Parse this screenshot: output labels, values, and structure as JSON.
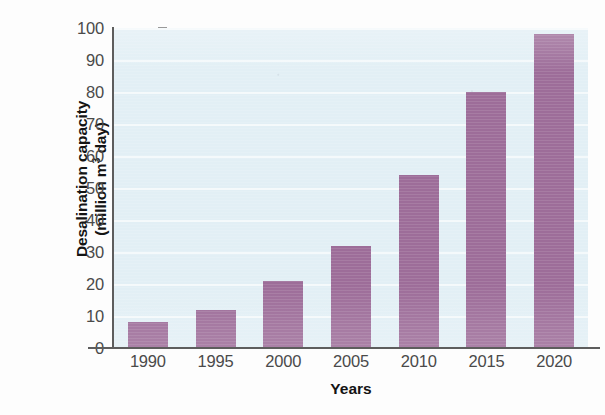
{
  "chart_data": {
    "type": "bar",
    "title": "",
    "xlabel": "Years",
    "ylabel_line1": "Desalination capacity",
    "ylabel_line2_pre": "(million m",
    "ylabel_line2_sup": "3",
    "ylabel_line2_post": " day)",
    "ylabel_plain": "Desalination capacity (million m3 day)",
    "categories": [
      "1990",
      "1995",
      "2000",
      "2005",
      "2010",
      "2015",
      "2020"
    ],
    "values": [
      8,
      12,
      21,
      32,
      54,
      80,
      98
    ],
    "ylim": [
      0,
      100
    ],
    "ytick_labels": [
      "0",
      "10",
      "20",
      "30",
      "40",
      "50",
      "60",
      "70",
      "80",
      "90",
      "100"
    ],
    "ytick_values": [
      0,
      10,
      20,
      30,
      40,
      50,
      60,
      70,
      80,
      90,
      100
    ],
    "grid": "horizontal",
    "legend": "none",
    "series": [
      {
        "name": "Desalination capacity",
        "values": [
          8,
          12,
          21,
          32,
          54,
          80,
          98
        ]
      }
    ]
  },
  "style": {
    "bar_color": "#9d6d99",
    "plot_background": "#e2eff5",
    "gridline_color": "#ffffff",
    "axis_color": "#5d5d5d",
    "tick_text_color": "#4a4a4a",
    "axis_title_color": "#141414",
    "page_background": "#fdfdfd"
  }
}
